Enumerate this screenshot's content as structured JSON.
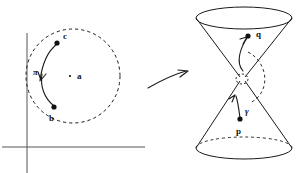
{
  "figure": {
    "stroke_color": "#1a1a1a",
    "axis_color": "#555555",
    "background": "#ffffff"
  },
  "left_panel": {
    "name": "disk-with-path",
    "boundary": {
      "style": "dashed",
      "cx": 73,
      "cy": 76,
      "r": 47
    },
    "axes": {
      "horizontal": {
        "y": 147,
        "x1": 2,
        "x2": 145
      },
      "vertical": {
        "x": 27,
        "y1": 33,
        "y2": 173
      }
    },
    "points": [
      {
        "label": "c",
        "x": 57,
        "y": 43,
        "label_x": 63,
        "label_y": 32,
        "dot": true
      },
      {
        "label": "b",
        "x": 54,
        "y": 107,
        "label_x": 49,
        "label_y": 114,
        "dot": true
      },
      {
        "label": "a",
        "x": 70,
        "y": 76,
        "label_x": 77,
        "label_y": 72,
        "dot": true
      }
    ],
    "curve": {
      "label": "π",
      "label_x": 33,
      "label_y": 68,
      "from": "b",
      "to": "c",
      "arrow": true
    }
  },
  "mapping_arrow": {
    "name": "maps-to-arrow",
    "from_x": 148,
    "from_y": 88,
    "to_x": 188,
    "to_y": 72
  },
  "right_panel": {
    "name": "double-light-cone",
    "top_ellipse": {
      "cx": 244,
      "cy": 18,
      "rx": 48,
      "ry": 11
    },
    "bottom_ellipse": {
      "cx": 244,
      "cy": 148,
      "rx": 48,
      "ry": 11
    },
    "apex": {
      "cx": 242,
      "cy": 79,
      "rx": 6,
      "ry": 5
    },
    "points": [
      {
        "label": "q",
        "x": 248,
        "y": 36,
        "label_x": 256,
        "label_y": 30,
        "dot": true
      },
      {
        "label": "p",
        "x": 240,
        "y": 119,
        "label_x": 236,
        "label_y": 127,
        "dot": true
      }
    ],
    "curve": {
      "label": "γ",
      "label_x": 245,
      "label_y": 107,
      "from": "p",
      "to": "q",
      "arrow": true
    }
  }
}
